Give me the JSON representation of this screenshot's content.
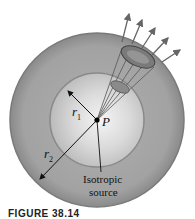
{
  "figure": {
    "caption": "FIGURE 38.14",
    "labels": {
      "r1": "r",
      "r1_sub": "1",
      "r2": "r",
      "r2_sub": "2",
      "point": "P",
      "source_line1": "Isotropic",
      "source_line2": "source"
    },
    "colors": {
      "outer_sphere": "#9a9a9a",
      "outer_rim": "#7d7d7d",
      "inner_sphere": "#c9c9c9",
      "inner_highlight": "#f2f2f2",
      "cone": "#6f6f6f",
      "arrows": "#666666",
      "line": "#111111"
    },
    "arrow_count": 5
  }
}
